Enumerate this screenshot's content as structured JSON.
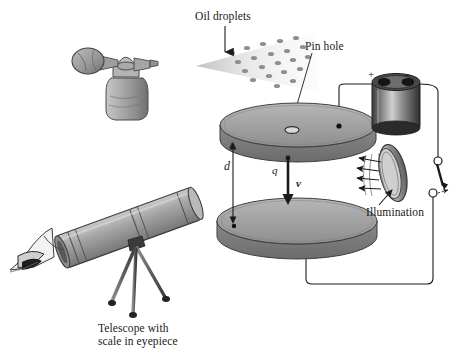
{
  "figure": {
    "background_color": "#ffffff",
    "ink_color": "#1a1a1a",
    "metal_gray": "#9a9a9a"
  },
  "labels": {
    "oil_droplets": "Oil droplets",
    "pin_hole": "Pin hole",
    "illumination": "Illumination",
    "telescope_line1": "Telescope with",
    "telescope_line2": "scale in eyepiece",
    "plate_separation": "d",
    "charge": "q",
    "velocity": "v",
    "battery_positive": "+",
    "battery_negative": "–"
  },
  "parts": {
    "atomizer": "atomizer-sprayer",
    "spray_cone": "oil-spray-cone",
    "top_plate": "top-capacitor-plate",
    "bottom_plate": "bottom-capacitor-plate",
    "pinhole": "pin-hole-opening",
    "battery": "battery-cell",
    "switch": "knife-switch",
    "lamp": "illumination-ring",
    "telescope": "telescope-on-tripod",
    "observer": "observer-eye"
  },
  "droplets": {
    "count": 21,
    "positions": [
      [
        232,
        53
      ],
      [
        247,
        48
      ],
      [
        262,
        44
      ],
      [
        279,
        41
      ],
      [
        294,
        38
      ],
      [
        238,
        62
      ],
      [
        254,
        58
      ],
      [
        270,
        54
      ],
      [
        286,
        50
      ],
      [
        301,
        47
      ],
      [
        245,
        71
      ],
      [
        261,
        67
      ],
      [
        277,
        63
      ],
      [
        292,
        59
      ],
      [
        306,
        56
      ],
      [
        252,
        80
      ],
      [
        268,
        76
      ],
      [
        283,
        72
      ],
      [
        298,
        68
      ],
      [
        276,
        85
      ],
      [
        292,
        80
      ]
    ]
  }
}
